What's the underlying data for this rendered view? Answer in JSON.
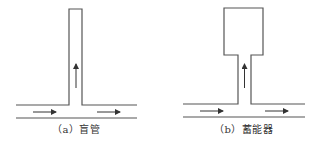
{
  "figures": [
    {
      "id": "a",
      "caption": "（a）盲管",
      "shape": "dead-end-pipe",
      "flow_arrows": [
        "right",
        "up",
        "right"
      ]
    },
    {
      "id": "b",
      "caption": "（b）蓄能器",
      "shape": "accumulator",
      "flow_arrows": [
        "right",
        "up",
        "right"
      ]
    }
  ],
  "colors": {
    "line": "#555555",
    "background": "#ffffff"
  }
}
